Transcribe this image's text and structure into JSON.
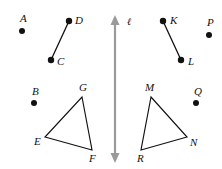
{
  "figure": {
    "width": 222,
    "height": 169,
    "background": "#ffffff",
    "ink_color": "#111111",
    "mirror_color": "#9a9a9a"
  },
  "mirror": {
    "label": "ℓ",
    "name": "line-l",
    "x": 115,
    "y_top": 19,
    "y_bottom": 159,
    "label_x": 127,
    "label_y": 25,
    "arrow_both_ends": true
  },
  "points": [
    {
      "id": "A",
      "label": "A",
      "cx": 22,
      "cy": 31,
      "r": 3.0,
      "label_x": 20,
      "label_y": 22
    },
    {
      "id": "B",
      "label": "B",
      "cx": 34,
      "cy": 103,
      "r": 3.0,
      "label_x": 32,
      "label_y": 95
    },
    {
      "id": "P",
      "label": "P",
      "cx": 209,
      "cy": 35,
      "r": 3.0,
      "label_x": 207,
      "label_y": 26
    },
    {
      "id": "Q",
      "label": "Q",
      "cx": 196,
      "cy": 103,
      "r": 3.0,
      "label_x": 194,
      "label_y": 95
    }
  ],
  "segments": [
    {
      "id": "CD",
      "name": "segment-cd",
      "endpoints": [
        {
          "id": "D",
          "label": "D",
          "cx": 69,
          "cy": 21,
          "r": 3.2,
          "label_x": 75,
          "label_y": 24
        },
        {
          "id": "C",
          "label": "C",
          "cx": 51,
          "cy": 60,
          "r": 3.2,
          "label_x": 57,
          "label_y": 65
        }
      ]
    },
    {
      "id": "KL",
      "name": "segment-kl",
      "endpoints": [
        {
          "id": "K",
          "label": "K",
          "cx": 163,
          "cy": 21,
          "r": 3.2,
          "label_x": 170,
          "label_y": 24
        },
        {
          "id": "L",
          "label": "L",
          "cx": 181,
          "cy": 60,
          "r": 3.2,
          "label_x": 188,
          "label_y": 65
        }
      ]
    }
  ],
  "triangles": [
    {
      "id": "EFG",
      "name": "triangle-efg",
      "vertices": [
        {
          "id": "G",
          "label": "G",
          "x": 82,
          "y": 97,
          "label_x": 79,
          "label_y": 91
        },
        {
          "id": "F",
          "label": "F",
          "x": 92,
          "y": 150,
          "label_x": 89,
          "label_y": 162
        },
        {
          "id": "E",
          "label": "E",
          "x": 45,
          "y": 137,
          "label_x": 35,
          "label_y": 145
        }
      ]
    },
    {
      "id": "MNR",
      "name": "triangle-mnr",
      "vertices": [
        {
          "id": "M",
          "label": "M",
          "x": 151,
          "y": 97,
          "label_x": 146,
          "label_y": 91
        },
        {
          "id": "N",
          "label": "N",
          "x": 187,
          "y": 137,
          "label_x": 190,
          "label_y": 146
        },
        {
          "id": "R",
          "label": "R",
          "x": 141,
          "y": 150,
          "label_x": 138,
          "label_y": 162
        }
      ]
    }
  ]
}
